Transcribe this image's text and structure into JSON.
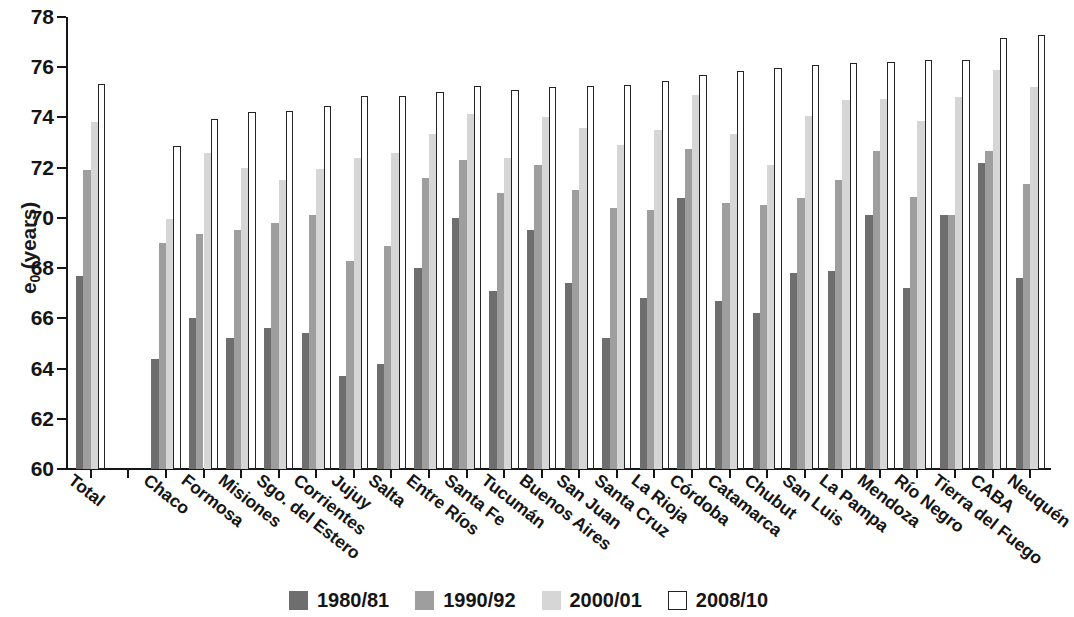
{
  "chart_data": {
    "type": "bar",
    "title": "",
    "subtitle": "",
    "xlabel": "",
    "ylabel": "e0 (years)",
    "ylabel_base": "e",
    "ylabel_sub": "0",
    "ylabel_unit": " (years)",
    "ylim": [
      60,
      78
    ],
    "yticks": [
      60,
      62,
      64,
      66,
      68,
      70,
      72,
      74,
      76,
      78
    ],
    "ytick_labels": [
      "60",
      "62",
      "64",
      "66",
      "68",
      "70",
      "72",
      "74",
      "76",
      "78"
    ],
    "grid": false,
    "legend_position": "bottom-center",
    "categories": [
      "Total",
      "Chaco",
      "Formosa",
      "Misiones",
      "Sgo. del Estero",
      "Corrientes",
      "Jujuy",
      "Salta",
      "Entre Ríos",
      "Santa Fe",
      "Tucumán",
      "Buenos Aires",
      "San Juan",
      "Santa Cruz",
      "La Rioja",
      "Córdoba",
      "Catamarca",
      "Chubut",
      "San Luis",
      "La Pampa",
      "Mendoza",
      "Río Negro",
      "Tierra del Fuego",
      "CABA",
      "Neuquén"
    ],
    "category_gap_after": [
      "Total"
    ],
    "series": [
      {
        "name": "1980/81",
        "color": "#6e6e6e",
        "values": [
          67.7,
          64.4,
          66.0,
          65.2,
          65.6,
          65.4,
          63.7,
          64.2,
          68.0,
          70.0,
          67.1,
          69.5,
          67.4,
          65.2,
          66.8,
          70.8,
          66.7,
          66.2,
          67.8,
          67.9,
          70.1,
          67.2,
          70.1,
          72.2,
          67.6
        ]
      },
      {
        "name": "1990/92",
        "color": "#9e9e9e",
        "values": [
          71.9,
          69.0,
          69.35,
          69.5,
          69.8,
          70.1,
          68.3,
          68.9,
          71.6,
          72.3,
          71.0,
          72.1,
          71.1,
          70.4,
          70.3,
          72.75,
          70.6,
          70.5,
          70.8,
          71.5,
          72.65,
          70.85,
          70.1,
          72.65,
          71.35
        ]
      },
      {
        "name": "2000/01",
        "color": "#d6d6d6",
        "values": [
          73.8,
          69.95,
          72.6,
          72.0,
          71.5,
          71.95,
          72.4,
          72.6,
          73.35,
          74.15,
          72.4,
          74.0,
          73.6,
          72.9,
          73.5,
          74.9,
          73.35,
          72.1,
          74.05,
          74.7,
          74.75,
          73.85,
          74.8,
          75.9,
          75.2
        ]
      },
      {
        "name": "2008/10",
        "color": "#ffffff",
        "outline": "#242424",
        "values": [
          75.35,
          72.85,
          73.95,
          74.2,
          74.25,
          74.45,
          74.85,
          74.85,
          75.0,
          75.25,
          75.1,
          75.2,
          75.25,
          75.3,
          75.45,
          75.7,
          75.85,
          75.95,
          76.1,
          76.15,
          76.2,
          76.3,
          76.3,
          77.15,
          77.3
        ]
      }
    ]
  },
  "legend": {
    "items": [
      {
        "label": "1980/81",
        "swatch": "s0"
      },
      {
        "label": "1990/92",
        "swatch": "s1"
      },
      {
        "label": "2000/01",
        "swatch": "s2"
      },
      {
        "label": "2008/10",
        "swatch": "s3"
      }
    ]
  }
}
